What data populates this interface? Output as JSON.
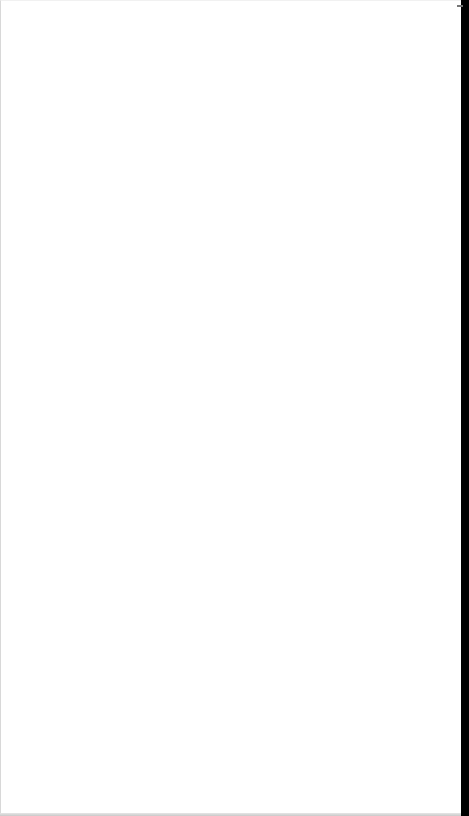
{
  "page": {
    "background_color": "#ffffff",
    "content": []
  },
  "edge_bar": {
    "color": "#000000"
  }
}
